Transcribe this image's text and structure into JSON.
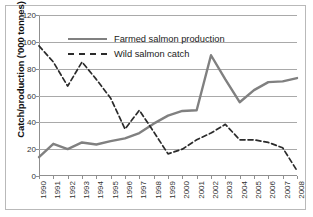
{
  "chart_data": {
    "type": "line",
    "title": "",
    "xlabel": "",
    "ylabel": "Catch/production ('000 tonnes)",
    "ylim": [
      0,
      120
    ],
    "yticks": [
      0,
      20,
      40,
      60,
      80,
      100,
      120
    ],
    "grid": true,
    "legend_position": "top-center-inside",
    "categories": [
      "1990",
      "1991",
      "1992",
      "1993",
      "1994",
      "1995",
      "1996",
      "1997",
      "1998",
      "1999",
      "2000",
      "2001",
      "2002",
      "2003",
      "2004",
      "2005",
      "2006",
      "2007",
      "2008"
    ],
    "series": [
      {
        "name": "Farmed salmon production",
        "style": "solid",
        "color": "#808080",
        "values": [
          14,
          24,
          20,
          25,
          23.5,
          26,
          28,
          32,
          39,
          45,
          48.5,
          49,
          90,
          72,
          55,
          64,
          70,
          70.5,
          73
        ]
      },
      {
        "name": "Wild salmon catch",
        "style": "dashed",
        "color": "#2b2b2b",
        "values": [
          97,
          85,
          67,
          85,
          72,
          58,
          35,
          49,
          33,
          16.5,
          20,
          27,
          32,
          38.5,
          27,
          27,
          25,
          21,
          4
        ]
      }
    ]
  },
  "axis": {
    "y_title": "Catch/production ('000 tonnes)",
    "y_ticks": [
      "0",
      "20",
      "40",
      "60",
      "80",
      "100",
      "120"
    ],
    "x_ticks": [
      "1990",
      "1991",
      "1992",
      "1993",
      "1994",
      "1995",
      "1996",
      "1997",
      "1998",
      "1999",
      "2000",
      "2001",
      "2002",
      "2003",
      "2004",
      "2005",
      "2006",
      "2007",
      "2008"
    ]
  },
  "legend": {
    "items": [
      {
        "label": "Farmed salmon production",
        "style": "solid",
        "color": "#808080"
      },
      {
        "label": "Wild salmon catch",
        "style": "dashed",
        "color": "#2b2b2b"
      }
    ]
  }
}
